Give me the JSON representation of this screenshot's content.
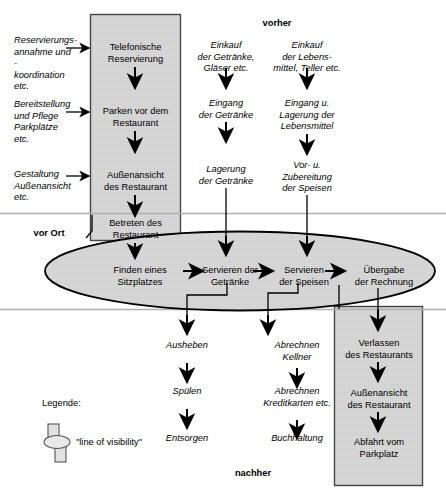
{
  "diagram": {
    "title_top": "vorher",
    "title_bottom": "nachher",
    "phase_label_middle": "vor Ort",
    "legend": {
      "heading": "Legende:",
      "symbol_name": "line-of-visibility-symbol",
      "caption": "\"line of visibility\""
    },
    "colors": {
      "band_fill": "#d4d4d4",
      "ellipse_fill": "#d4d4d4",
      "stroke": "#000000",
      "separator": "#b0b0b0"
    },
    "support_column": [
      {
        "id": "sup1",
        "text": "Reservierungs-\nannahme und -\nkoordination\netc."
      },
      {
        "id": "sup2",
        "text": "Bereitstellung\nund Pflege\nParkplätze\netc."
      },
      {
        "id": "sup3",
        "text": "Gestaltung\nAußenansicht\netc."
      }
    ],
    "onstage_column": [
      {
        "id": "on1",
        "text": "Telefonische\nReservierung"
      },
      {
        "id": "on2",
        "text": "Parken vor dem\nRestaurant"
      },
      {
        "id": "on3",
        "text": "Außenansicht\ndes Restaurant"
      },
      {
        "id": "on4",
        "text": "Betreten des\nRestaurant"
      }
    ],
    "drinks_column": [
      {
        "id": "dr1",
        "text": "Einkauf\nder Getränke,\nGläser etc."
      },
      {
        "id": "dr2",
        "text": "Eingang\nder Getränke"
      },
      {
        "id": "dr3",
        "text": "Lagerung\nder Getränke"
      }
    ],
    "food_column": [
      {
        "id": "fo1",
        "text": "Einkauf\nder Lebens-\nmittel, Teller etc."
      },
      {
        "id": "fo2",
        "text": "Eingang  u.\nLagerung der\nLebensmittel"
      },
      {
        "id": "fo3",
        "text": "Vor- u.\nZubereitung\nder Speisen"
      }
    ],
    "ellipse_row": [
      {
        "id": "el1",
        "text": "Finden eines\nSitzplatzes"
      },
      {
        "id": "el2",
        "text": "Servieren der\nGetränke"
      },
      {
        "id": "el3",
        "text": "Servieren\nder Speisen"
      },
      {
        "id": "el4",
        "text": "Übergabe\nder Rechnung"
      }
    ],
    "after_wash_column": [
      {
        "id": "aw1",
        "text": "Ausheben"
      },
      {
        "id": "aw2",
        "text": "Spülen"
      },
      {
        "id": "aw3",
        "text": "Entsorgen"
      }
    ],
    "after_billing_column": [
      {
        "id": "ab1",
        "text": "Abrechnen\nKellner"
      },
      {
        "id": "ab2",
        "text": "Abrechnen\nKreditkarten etc."
      },
      {
        "id": "ab3",
        "text": "Buchhaltung"
      }
    ],
    "after_guest_column": [
      {
        "id": "ag1",
        "text": "Verlassen\ndes Restaurants"
      },
      {
        "id": "ag2",
        "text": "Außenansicht\ndes Restaurant"
      },
      {
        "id": "ag3",
        "text": "Abfahrt vom\nParkplatz"
      }
    ]
  }
}
